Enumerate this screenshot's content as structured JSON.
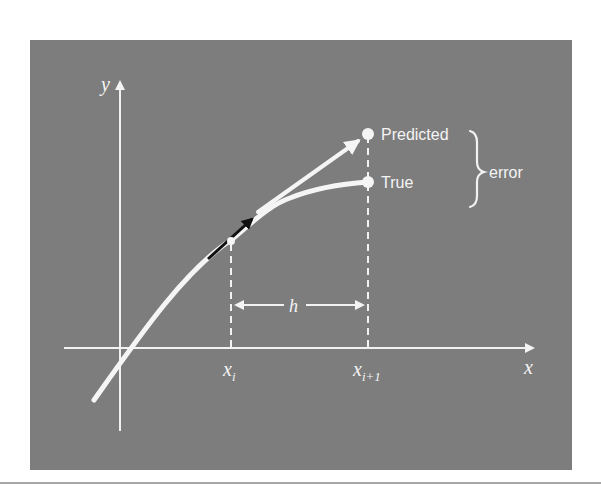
{
  "figure": {
    "colors": {
      "panel": "#7d7d7d",
      "foreground": "#f4f4f4",
      "tangent_arrow": "#111111",
      "page": "#ffffff"
    },
    "axes": {
      "x_label": "x",
      "y_label": "y"
    },
    "ticks": {
      "xi_main": "x",
      "xi_sub": "i",
      "xi1_main": "x",
      "xi1_sub": "i+1"
    },
    "step_label": "h",
    "points": {
      "predicted_label": "Predicted",
      "true_label": "True"
    },
    "brace_label": "error"
  }
}
